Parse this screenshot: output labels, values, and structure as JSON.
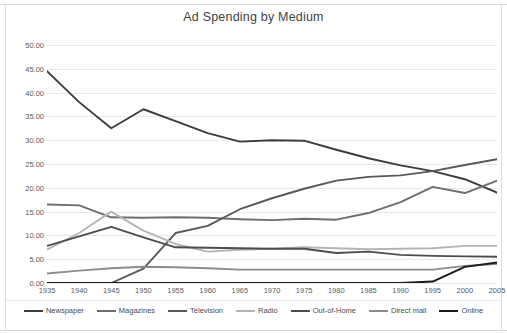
{
  "chart_data": {
    "type": "line",
    "title": "Ad Spending by Medium",
    "xlabel": "",
    "ylabel": "",
    "grid": true,
    "legend_position": "bottom",
    "ylim": [
      0,
      50
    ],
    "ytick_labels": [
      "0.00",
      "5.00",
      "10.00",
      "15.00",
      "20.00",
      "25.00",
      "30.00",
      "35.00",
      "40.00",
      "45.00",
      "50.00"
    ],
    "ytick_values": [
      0,
      5,
      10,
      15,
      20,
      25,
      30,
      35,
      40,
      45,
      50
    ],
    "categories": [
      "1935",
      "1940",
      "1945",
      "1950",
      "1955",
      "1960",
      "1965",
      "1970",
      "1975",
      "1980",
      "1985",
      "1990",
      "1995",
      "2000",
      "2005"
    ],
    "x": [
      1935,
      1940,
      1945,
      1950,
      1955,
      1960,
      1965,
      1970,
      1975,
      1980,
      1985,
      1990,
      1995,
      2000,
      2005
    ],
    "series": [
      {
        "name": "Newspaper",
        "color": "#3c3c3c",
        "values": [
          44.5,
          38.0,
          32.5,
          36.5,
          34.0,
          31.5,
          29.7,
          30.0,
          29.9,
          28.0,
          26.2,
          24.7,
          23.5,
          21.8,
          19.0
        ]
      },
      {
        "name": "Magazines",
        "color": "#6e6e6e",
        "values": [
          16.5,
          16.3,
          13.8,
          13.7,
          13.8,
          13.7,
          13.4,
          13.2,
          13.5,
          13.3,
          14.7,
          17.0,
          20.2,
          18.9,
          21.5
        ]
      },
      {
        "name": "Television",
        "color": "#595959",
        "values": [
          0.0,
          0.0,
          0.0,
          3.0,
          10.5,
          12.0,
          15.5,
          17.8,
          19.8,
          21.5,
          22.3,
          22.6,
          23.5,
          24.8,
          26.0
        ]
      },
      {
        "name": "Radio",
        "color": "#b5b5b5",
        "values": [
          7.0,
          10.5,
          15.0,
          11.0,
          8.2,
          6.6,
          7.0,
          7.2,
          7.5,
          7.3,
          7.1,
          7.2,
          7.3,
          7.8,
          7.8
        ]
      },
      {
        "name": "Out-of-Home",
        "color": "#4d4d4d",
        "values": [
          7.8,
          9.8,
          11.8,
          9.6,
          7.5,
          7.4,
          7.3,
          7.2,
          7.2,
          6.3,
          6.6,
          5.9,
          5.7,
          5.6,
          5.5
        ]
      },
      {
        "name": "Direct mail",
        "color": "#8c8c8c",
        "values": [
          2.0,
          2.6,
          3.1,
          3.4,
          3.3,
          3.1,
          2.8,
          2.8,
          2.8,
          2.8,
          2.8,
          2.8,
          2.8,
          3.6,
          4.0
        ]
      },
      {
        "name": "Online",
        "color": "#1a1a1a",
        "values": [
          0.0,
          0.0,
          0.0,
          0.0,
          0.0,
          0.0,
          0.0,
          0.0,
          0.0,
          0.0,
          0.0,
          0.0,
          0.3,
          3.4,
          4.3
        ]
      }
    ]
  }
}
